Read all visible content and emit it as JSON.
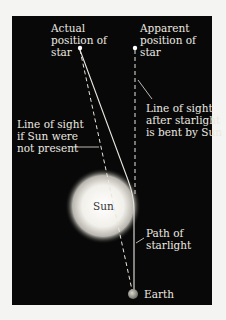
{
  "diagram": {
    "labels": {
      "actual_star": "Actual\nposition of\nstar",
      "apparent_star": "Apparent\nposition of\nstar",
      "bent_sight": "Line of sight\nafter starlight\nis bent by Sun",
      "unbent_sight": "Line of sight\nif Sun were\nnot present",
      "sun": "Sun",
      "path": "Path of\nstarlight",
      "earth": "Earth"
    },
    "colors": {
      "background": "#080808",
      "text": "#ece9e0",
      "lines": "#e8e6de",
      "sun_center": "#ffffff",
      "earth": "#9a9a90"
    }
  }
}
